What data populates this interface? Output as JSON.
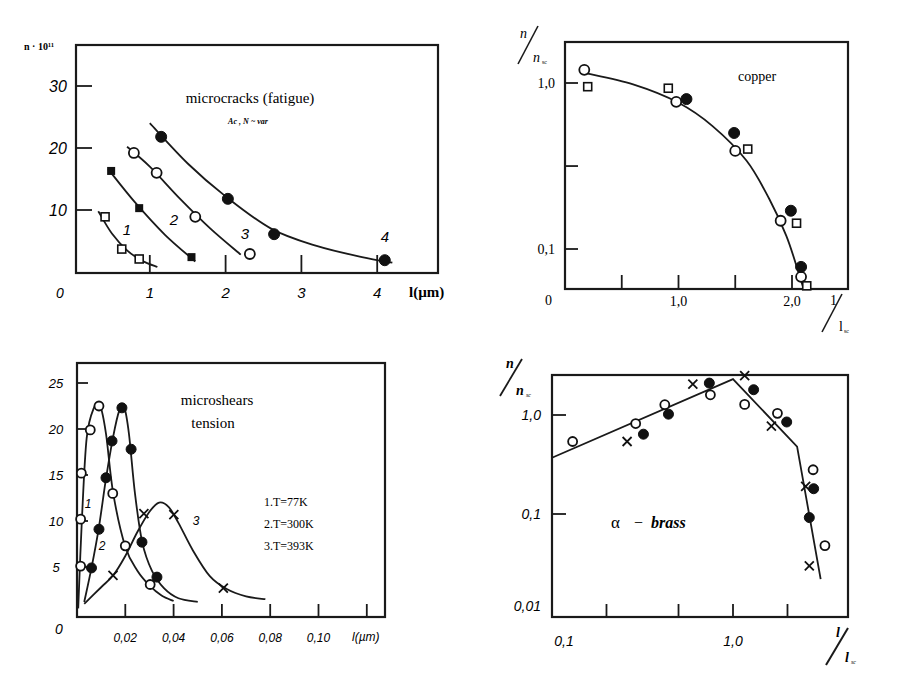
{
  "chart_data": [
    {
      "id": "microcracks",
      "type": "scatter",
      "title": "microcracks (fatigue)",
      "subtitle": "Ac , N ~ var",
      "xlabel": "l(µm)",
      "ylabel": "n · 10¹¹",
      "xlim": [
        0,
        4.8
      ],
      "ylim": [
        0,
        36
      ],
      "xticks": [
        0,
        1,
        2,
        3,
        4
      ],
      "xtick_labels": [
        "0",
        "1",
        "2",
        "3",
        "4"
      ],
      "yticks": [
        10,
        20,
        30
      ],
      "ytick_labels": [
        "10",
        "20",
        "30"
      ],
      "grid": false,
      "series": [
        {
          "name": "1",
          "marker": "open-square",
          "x": [
            0.41,
            0.63,
            0.86
          ],
          "y": [
            8.9,
            3.7,
            2.1
          ],
          "curve_x": [
            0.32,
            0.5,
            0.7,
            0.9,
            1.1
          ],
          "curve_y": [
            9.8,
            6.2,
            3.5,
            1.8,
            0.8
          ]
        },
        {
          "name": "2",
          "marker": "filled-square",
          "x": [
            0.49,
            0.86,
            1.55
          ],
          "y": [
            16.3,
            10.3,
            2.4
          ],
          "curve_x": [
            0.45,
            0.8,
            1.2,
            1.6
          ],
          "curve_y": [
            16.6,
            11.3,
            6.0,
            1.7
          ]
        },
        {
          "name": "3",
          "marker": "open-circle",
          "x": [
            0.79,
            1.09,
            1.6,
            2.32
          ],
          "y": [
            19.2,
            16.0,
            8.9,
            2.9
          ],
          "curve_x": [
            0.7,
            1.0,
            1.4,
            1.8,
            2.2
          ],
          "curve_y": [
            20.2,
            17.0,
            11.8,
            7.0,
            2.8
          ]
        },
        {
          "name": "4",
          "marker": "filled-circle",
          "x": [
            1.15,
            2.03,
            2.64,
            4.1
          ],
          "y": [
            21.8,
            11.8,
            6.1,
            1.9
          ],
          "curve_x": [
            1.0,
            1.5,
            2.0,
            2.6,
            3.2,
            3.8,
            4.2
          ],
          "curve_y": [
            24.0,
            17.5,
            12.2,
            7.0,
            4.2,
            2.4,
            1.5
          ]
        }
      ],
      "curve_labels": [
        "1",
        "2",
        "3",
        "4"
      ]
    },
    {
      "id": "copper",
      "type": "scatter",
      "title": "copper",
      "xlabel": "l / l_sc",
      "ylabel": "n / n_sc",
      "xscale": "linear",
      "yscale": "log",
      "xlim": [
        0,
        2.5
      ],
      "ylim": [
        0.045,
        1.6
      ],
      "xticks": [
        0.5,
        1.0,
        1.5,
        2.0
      ],
      "xtick_labels": [
        "",
        "1,0",
        "",
        "2,0"
      ],
      "yticks": [
        0.1,
        0.316,
        1.0
      ],
      "ytick_labels": [
        "0,1",
        "",
        "1,0"
      ],
      "origin_label": "0",
      "grid": false,
      "series": [
        {
          "name": "open circles",
          "marker": "open-circle",
          "x": [
            0.17,
            0.98,
            1.5,
            1.9,
            2.08
          ],
          "y": [
            1.2,
            0.77,
            0.39,
            0.148,
            0.068
          ]
        },
        {
          "name": "filled circles",
          "marker": "filled-circle",
          "x": [
            1.07,
            1.49,
            1.99,
            2.08
          ],
          "y": [
            0.8,
            0.5,
            0.17,
            0.078
          ]
        },
        {
          "name": "open squares",
          "marker": "open-square",
          "x": [
            0.2,
            0.91,
            1.61,
            2.04,
            2.13
          ],
          "y": [
            0.95,
            0.93,
            0.4,
            0.143,
            0.06
          ]
        }
      ],
      "fit_curve": {
        "x": [
          0.17,
          0.6,
          1.0,
          1.3,
          1.6,
          1.8,
          1.95,
          2.05,
          2.1
        ],
        "y": [
          1.15,
          0.98,
          0.76,
          0.55,
          0.34,
          0.2,
          0.12,
          0.075,
          0.058
        ]
      }
    },
    {
      "id": "microshears",
      "type": "line",
      "title": "microshears",
      "subtitle": "tension",
      "xlabel": "l(µm)",
      "ylabel": "",
      "xlim": [
        0,
        0.12
      ],
      "ylim": [
        0,
        27
      ],
      "xticks": [
        0.02,
        0.04,
        0.06,
        0.08,
        0.1,
        0.12
      ],
      "xtick_labels": [
        "0,02",
        "0,04",
        "0,06",
        "0,08",
        "0,10",
        ""
      ],
      "yticks": [
        5,
        10,
        15,
        20,
        25
      ],
      "ytick_labels": [
        "5",
        "10",
        "15",
        "20",
        "25"
      ],
      "origin_label": "0",
      "grid": false,
      "legend": [
        "1.T=77K",
        "2.T=300K",
        "3.T=393K"
      ],
      "series": [
        {
          "name": "1.T=77K",
          "marker": "open-circle",
          "x": [
            0.0015,
            0.0015,
            0.0018,
            0.0055,
            0.0091,
            0.0148,
            0.02,
            0.0303
          ],
          "y": [
            5.1,
            10.2,
            15.2,
            19.9,
            22.5,
            13.0,
            7.3,
            3.1
          ],
          "curve_x": [
            0.0005,
            0.002,
            0.004,
            0.007,
            0.0095,
            0.012,
            0.015,
            0.02,
            0.025,
            0.03,
            0.035,
            0.04
          ],
          "curve_y": [
            0.5,
            10,
            19,
            22.3,
            22.6,
            19.5,
            13,
            7.2,
            4.6,
            3.0,
            1.9,
            1.3
          ]
        },
        {
          "name": "2.T=300K",
          "marker": "filled-circle",
          "x": [
            0.006,
            0.0091,
            0.012,
            0.0145,
            0.0186,
            0.0224,
            0.0269,
            0.0331
          ],
          "y": [
            4.9,
            9.1,
            14.7,
            18.7,
            22.3,
            17.8,
            7.7,
            3.9
          ],
          "curve_x": [
            0.003,
            0.006,
            0.009,
            0.012,
            0.015,
            0.0175,
            0.0195,
            0.0215,
            0.024,
            0.027,
            0.031,
            0.036,
            0.042,
            0.05
          ],
          "curve_y": [
            1.2,
            4.9,
            9.2,
            14.6,
            19.2,
            22.0,
            22.4,
            19.5,
            13.0,
            7.7,
            4.6,
            2.7,
            1.6,
            1.2
          ]
        },
        {
          "name": "3.T=393K",
          "marker": "cross",
          "x": [
            0.0149,
            0.0277,
            0.0401,
            0.0606
          ],
          "y": [
            4.1,
            10.8,
            10.7,
            2.7
          ],
          "curve_x": [
            0.003,
            0.01,
            0.015,
            0.02,
            0.025,
            0.03,
            0.034,
            0.038,
            0.042,
            0.048,
            0.055,
            0.062,
            0.07,
            0.078
          ],
          "curve_y": [
            1.0,
            2.8,
            4.1,
            6.2,
            8.8,
            11.0,
            12.0,
            11.5,
            9.8,
            6.8,
            4.0,
            2.6,
            1.8,
            1.5
          ]
        }
      ],
      "curve_labels": [
        "1",
        "2",
        "3"
      ]
    },
    {
      "id": "alpha-brass",
      "type": "scatter",
      "title": "α − brass",
      "xlabel": "l / l_sc",
      "ylabel": "n / n_sc",
      "xscale": "log",
      "yscale": "log",
      "xlim": [
        0.1,
        4.2
      ],
      "ylim": [
        0.01,
        2.8
      ],
      "xticks": [
        0.2,
        0.5,
        1.0,
        2.0
      ],
      "xtick_labels": [
        "0,1",
        "",
        "",
        "1,0",
        ""
      ],
      "yticks": [
        0.01,
        0.1,
        1.0
      ],
      "ytick_labels": [
        "0,01",
        "0,1",
        "1,0"
      ],
      "grid": false,
      "series": [
        {
          "name": "open circles",
          "marker": "open-circle",
          "x": [
            0.13,
            0.29,
            0.42,
            0.75,
            1.16,
            1.76,
            2.77,
            3.22
          ],
          "y": [
            0.54,
            0.82,
            1.27,
            1.6,
            1.28,
            1.04,
            0.28,
            0.048
          ]
        },
        {
          "name": "filled circles",
          "marker": "filled-circle",
          "x": [
            0.32,
            0.44,
            0.74,
            1.3,
            1.98,
            2.79,
            2.64
          ],
          "y": [
            0.64,
            1.02,
            2.1,
            1.8,
            0.85,
            0.18,
            0.092
          ]
        },
        {
          "name": "crosses",
          "marker": "cross",
          "x": [
            0.26,
            0.6,
            1.16,
            1.63,
            2.52,
            2.64
          ],
          "y": [
            0.54,
            2.05,
            2.5,
            0.77,
            0.19,
            0.03
          ]
        }
      ],
      "fit_line": {
        "x": [
          0.1,
          1.0,
          2.26,
          3.05
        ],
        "y": [
          0.37,
          2.3,
          0.48,
          0.022
        ]
      }
    }
  ],
  "labels": {
    "mc_ylabel": "n · 10¹¹",
    "mc_title": "microcracks (fatigue)",
    "mc_subtitle": "Ac , N ~ var",
    "mc_xlabel": "l(µm)",
    "mc_origin": "0",
    "cu_title": "copper",
    "cu_origin": "0",
    "ms_title": "microshears",
    "ms_subtitle": "tension",
    "ms_xlabel": "l(µm)",
    "ms_origin": "0",
    "ms_legend_1": "1.T=77K",
    "ms_legend_2": "2.T=300K",
    "ms_legend_3": "3.T=393K",
    "br_title_alpha": "α",
    "br_title_dash": "−",
    "br_title_name": "brass"
  }
}
